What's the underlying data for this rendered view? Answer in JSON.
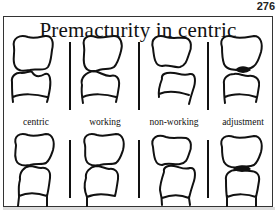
{
  "page_number": "276",
  "title": "Premacturity in centric",
  "columns": [
    {
      "label": "centric",
      "condition": "premature contact in centric"
    },
    {
      "label": "working",
      "condition": "premature contact on working side"
    },
    {
      "label": "non-working",
      "condition": "premature contact on non-working side"
    },
    {
      "label": "adjustment",
      "condition": "contact after adjustment"
    }
  ],
  "colors": {
    "line": "#111111",
    "background": "#ffffff",
    "border": "#333333"
  }
}
